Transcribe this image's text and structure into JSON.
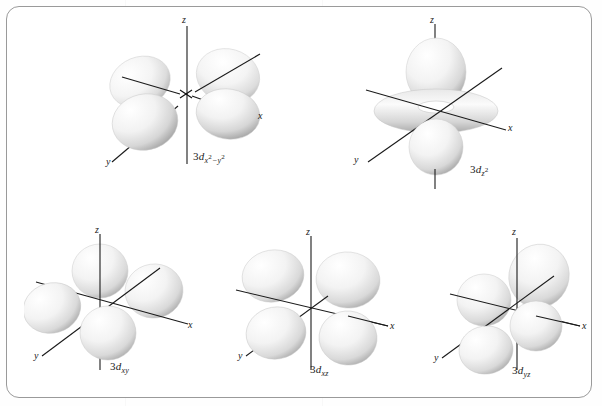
{
  "figure": {
    "title": "",
    "border_color": "#9a9a9a",
    "background_color": "#ffffff",
    "lobe_fill_light": "#ffffff",
    "lobe_fill_shadow": "#b9b9b9",
    "axis_color": "#1a1a1a",
    "text_color": "#1c1c1c"
  },
  "orbitals": [
    {
      "id": "3d-x2-y2",
      "name": "3d x squared minus y squared orbital",
      "label_lead": "3",
      "label_d": "d",
      "label_sub_a": "x",
      "label_sup_a": "2",
      "label_minus": "−",
      "label_sub_b": "y",
      "label_sup_b": "2",
      "axis_labels": {
        "z": "z",
        "x": "x",
        "y": "y"
      },
      "lobe_count": 4,
      "lobe_arrangement": "four lobes along x and y axes in horizontal plane"
    },
    {
      "id": "3d-z2",
      "name": "3d z squared orbital",
      "label_lead": "3",
      "label_d": "d",
      "label_sub_a": "z",
      "label_sup_a": "2",
      "label_minus": "",
      "label_sub_b": "",
      "label_sup_b": "",
      "axis_labels": {
        "z": "z",
        "x": "x",
        "y": "y"
      },
      "lobe_count": 2,
      "lobe_arrangement": "two lobes along z axis with a torus ring in the xy plane"
    },
    {
      "id": "3d-xy",
      "name": "3d xy orbital",
      "label_lead": "3",
      "label_d": "d",
      "label_sub_a": "xy",
      "label_sup_a": "",
      "label_minus": "",
      "label_sub_b": "",
      "label_sup_b": "",
      "axis_labels": {
        "z": "z",
        "x": "x",
        "y": "y"
      },
      "lobe_count": 4,
      "lobe_arrangement": "four lobes between x and y axes"
    },
    {
      "id": "3d-xz",
      "name": "3d xz orbital",
      "label_lead": "3",
      "label_d": "d",
      "label_sub_a": "xz",
      "label_sup_a": "",
      "label_minus": "",
      "label_sub_b": "",
      "label_sup_b": "",
      "axis_labels": {
        "z": "z",
        "x": "x",
        "y": "y"
      },
      "lobe_count": 4,
      "lobe_arrangement": "four lobes between x and z axes"
    },
    {
      "id": "3d-yz",
      "name": "3d yz orbital",
      "label_lead": "3",
      "label_d": "d",
      "label_sub_a": "yz",
      "label_sup_a": "",
      "label_minus": "",
      "label_sub_b": "",
      "label_sup_b": "",
      "axis_labels": {
        "z": "z",
        "x": "x",
        "y": "y"
      },
      "lobe_count": 4,
      "lobe_arrangement": "four lobes between y and z axes"
    }
  ]
}
